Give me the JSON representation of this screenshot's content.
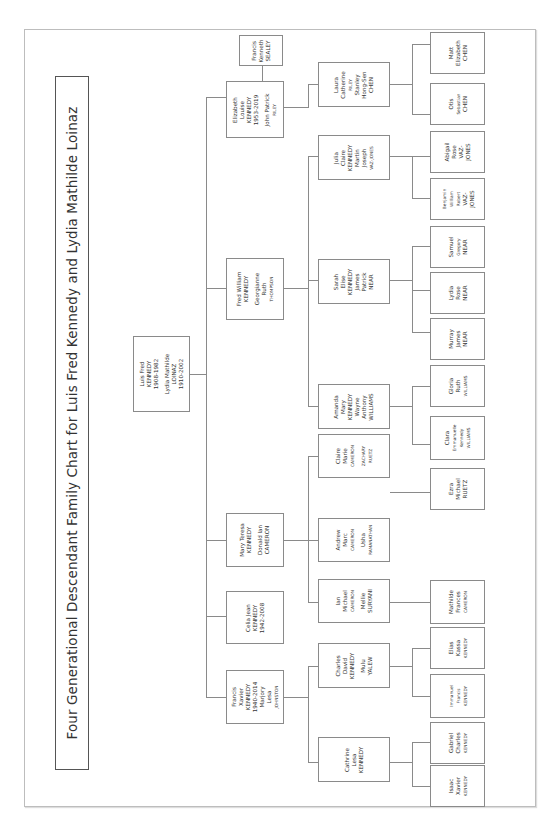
{
  "title": "Four Generational Descendant Family Chart for Luis Fred Kennedy and Lydia Mathilde Loinaz",
  "root": {
    "lines": [
      "Luis Fred",
      "KENNEDY",
      "1908-1982",
      "",
      "Lydia Mathilde",
      "LOINAZ",
      "1910-2002"
    ]
  },
  "generation2": [
    {
      "id": "elizabeth",
      "lines": [
        "Elizabeth",
        "Louise",
        "KENNEDY",
        "1953-2019",
        "",
        "John Patrick",
        "RILEY"
      ]
    },
    {
      "id": "fred",
      "lines": [
        "Fred William",
        "KENNEDY",
        "",
        "Georgianne",
        "Ruth",
        "THOMPSON"
      ]
    },
    {
      "id": "mary",
      "lines": [
        "Mary Teresa",
        "KENNEDY",
        "",
        "Donald Ian",
        "CAMERON"
      ]
    },
    {
      "id": "celia",
      "lines": [
        "Celia Jean",
        "KENNEDY",
        "1942-2008"
      ]
    },
    {
      "id": "francis",
      "lines": [
        "Francis",
        "Xavier",
        "KENNEDY",
        "1940-2014",
        "Marjory",
        "Lesa",
        "JOHNSTON"
      ]
    }
  ],
  "spouse_extra": {
    "id": "sealey",
    "lines": [
      "Francis",
      "Kenneth",
      "SEALEY"
    ]
  },
  "generation3": [
    {
      "id": "laura",
      "lines": [
        "Laura",
        "Catherine",
        "RILEY",
        "Stanley",
        "Hong-Sen",
        "CHEN"
      ]
    },
    {
      "id": "julia",
      "lines": [
        "Julia",
        "Claire",
        "KENNEDY",
        "Martin",
        "Joseph",
        "VAZ-JONES"
      ]
    },
    {
      "id": "sarah",
      "lines": [
        "Sarah",
        "Elise",
        "KENNEDY",
        "James",
        "Patrick",
        "NEAR"
      ]
    },
    {
      "id": "amanda",
      "lines": [
        "Amanda",
        "Mary",
        "KENNEDY",
        "Wayne",
        "Anthony",
        "WILLIAMS"
      ]
    },
    {
      "id": "claire",
      "lines": [
        "Claire",
        "Marie",
        "CAMERON",
        "",
        "ZACHARY",
        "RUETZ"
      ]
    },
    {
      "id": "andrew",
      "lines": [
        "Andrew",
        "Marc",
        "CAMERON",
        "",
        "Usha",
        "RAMANATHAN"
      ]
    },
    {
      "id": "ian",
      "lines": [
        "Ian",
        "Michael",
        "CAMERON",
        "",
        "Mellie",
        "SURYANI"
      ]
    },
    {
      "id": "charles",
      "lines": [
        "Charles",
        "David",
        "KENNEDY",
        "",
        "Mulu",
        "YALEW"
      ]
    },
    {
      "id": "cathrine",
      "lines": [
        "Cathrine",
        "Lesa",
        "KENNEDY"
      ]
    }
  ],
  "generation4": [
    {
      "id": "matt",
      "lines": [
        "Matt",
        "Elizabeth",
        "CHEN"
      ]
    },
    {
      "id": "otis",
      "lines": [
        "Otis",
        "Sebastian",
        "CHEN"
      ]
    },
    {
      "id": "abigail",
      "lines": [
        "Abigail",
        "Rose",
        "VAZ-",
        "JONES"
      ]
    },
    {
      "id": "benjamin",
      "lines": [
        "Benjamin",
        "William",
        "Robert",
        "VAZ-",
        "JONES"
      ]
    },
    {
      "id": "samuel",
      "lines": [
        "Samuel",
        "Gregory",
        "NEAR"
      ]
    },
    {
      "id": "lydia",
      "lines": [
        "Lydia",
        "Rose",
        "NEAR"
      ]
    },
    {
      "id": "murray",
      "lines": [
        "Murray",
        "James",
        "NEAR"
      ]
    },
    {
      "id": "gloria",
      "lines": [
        "Gloria",
        "Ruth",
        "WILLIAMS"
      ]
    },
    {
      "id": "clara",
      "lines": [
        "Clara",
        "Emmanuelle",
        "Kennedy",
        "WILLIAMS"
      ]
    },
    {
      "id": "ezra",
      "lines": [
        "Ezra",
        "Michael",
        "RUETZ"
      ]
    },
    {
      "id": "mathilde",
      "lines": [
        "Mathilde",
        "Frances",
        "CAMERON"
      ]
    },
    {
      "id": "elias",
      "lines": [
        "Elias",
        "Kassa",
        "KENNEDY"
      ]
    },
    {
      "id": "immanuel",
      "lines": [
        "Immanuel",
        "Francis",
        "KENNEDY"
      ]
    },
    {
      "id": "gabriel",
      "lines": [
        "Gabriel",
        "Charles",
        "KENNEDY"
      ]
    },
    {
      "id": "isaac",
      "lines": [
        "Isaac",
        "Xavier",
        "KENNEDY"
      ]
    }
  ]
}
